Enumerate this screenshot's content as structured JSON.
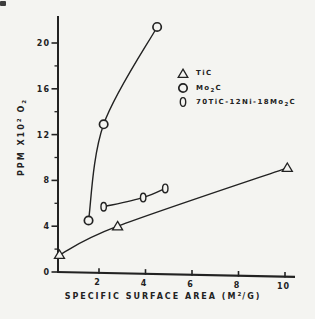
{
  "figure": {
    "paper": "#f4f4f1",
    "ink": "#222222",
    "marker_fill": "#f4f4f1"
  },
  "chart_data": {
    "type": "scatter",
    "title": "",
    "xlabel": {
      "pre": "SPECIFIC SURFACE AREA (M",
      "sup": "2",
      "post": "/G)"
    },
    "ylabel": {
      "pre": "PPM X10",
      "sup": "2",
      "mid": " O",
      "sub": "2"
    },
    "xlim": [
      0,
      10.5
    ],
    "ylim": [
      0,
      22.5
    ],
    "x_ticks": [
      "2",
      "4",
      "6",
      "8",
      "10"
    ],
    "x_tick_values": [
      2,
      4,
      6,
      8,
      10
    ],
    "y_ticks": [
      "0",
      "4",
      "8",
      "12",
      "16",
      "20"
    ],
    "y_tick_values": [
      0,
      4,
      8,
      12,
      16,
      20
    ],
    "y_minor_tick_values": [
      2,
      6,
      10,
      14,
      18
    ],
    "grid": false,
    "legend_position": "upper right",
    "series": [
      {
        "name": "TiC",
        "marker": "triangle",
        "points": [
          [
            0.3,
            1.5
          ],
          [
            2.8,
            4.0
          ],
          [
            10.1,
            9.1
          ]
        ]
      },
      {
        "name": "Mo2C",
        "marker": "circle",
        "points": [
          [
            1.55,
            4.5
          ],
          [
            2.2,
            12.9
          ],
          [
            4.5,
            21.4
          ]
        ]
      },
      {
        "name": "70TiC-12Ni-18Mo2C",
        "marker": "ellipse",
        "points": [
          [
            2.2,
            5.7
          ],
          [
            3.9,
            6.5
          ],
          [
            4.85,
            7.3
          ]
        ]
      }
    ],
    "legend": [
      {
        "marker": "triangle",
        "label": {
          "pre": "TiC",
          "sub": "",
          "post": ""
        }
      },
      {
        "marker": "circle",
        "label": {
          "pre": "Mo",
          "sub": "2",
          "post": "C"
        }
      },
      {
        "marker": "ellipse",
        "label": {
          "pre": "70TiC-12Ni-18Mo",
          "sub": "2",
          "post": "C"
        }
      }
    ]
  }
}
